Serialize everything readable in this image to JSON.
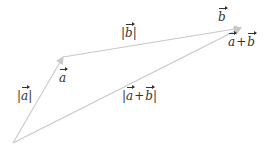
{
  "diagram": {
    "colors": {
      "line": "#c8c8c8",
      "text": "#333333",
      "background": "#ffffff"
    },
    "points": {
      "O": [
        13,
        143
      ],
      "A": [
        63,
        57
      ],
      "B": [
        241,
        28
      ]
    },
    "edges": [
      {
        "id": "a",
        "from": "O",
        "to": "A",
        "label": "a"
      },
      {
        "id": "b",
        "from": "A",
        "to": "B",
        "label": "b"
      },
      {
        "id": "sum",
        "from": "O",
        "to": "B",
        "label": "a+b"
      }
    ],
    "labels": {
      "abs_a": {
        "bar": "|",
        "var": "a"
      },
      "vec_a": {
        "var": "a"
      },
      "abs_b": {
        "bar": "|",
        "var": "b"
      },
      "vec_b": {
        "var": "b"
      },
      "vec_sum": {
        "var1": "a",
        "op": "+",
        "var2": "b"
      },
      "abs_sum": {
        "bar": "|",
        "var1": "a",
        "op": "+",
        "var2": "b"
      }
    }
  }
}
